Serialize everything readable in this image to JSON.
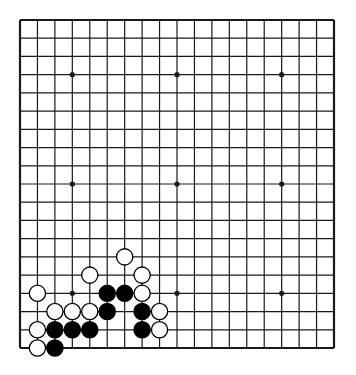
{
  "board": {
    "size": 19,
    "left": 20,
    "top": 20,
    "right": 334,
    "bottom": 348,
    "line_color": "#1a1a1a",
    "background": "#ffffff",
    "star_points": [
      [
        3,
        3
      ],
      [
        9,
        3
      ],
      [
        15,
        3
      ],
      [
        3,
        9
      ],
      [
        9,
        9
      ],
      [
        15,
        9
      ],
      [
        3,
        15
      ],
      [
        9,
        15
      ],
      [
        15,
        15
      ]
    ],
    "stones": [
      {
        "color": "white",
        "col": 6,
        "row": 13
      },
      {
        "color": "white",
        "col": 4,
        "row": 14
      },
      {
        "color": "white",
        "col": 7,
        "row": 14
      },
      {
        "color": "white",
        "col": 1,
        "row": 15
      },
      {
        "color": "black",
        "col": 5,
        "row": 15
      },
      {
        "color": "black",
        "col": 6,
        "row": 15
      },
      {
        "color": "white",
        "col": 7,
        "row": 15
      },
      {
        "color": "white",
        "col": 2,
        "row": 16
      },
      {
        "color": "white",
        "col": 3,
        "row": 16
      },
      {
        "color": "white",
        "col": 4,
        "row": 16
      },
      {
        "color": "black",
        "col": 5,
        "row": 16
      },
      {
        "color": "black",
        "col": 7,
        "row": 16
      },
      {
        "color": "white",
        "col": 8,
        "row": 16
      },
      {
        "color": "white",
        "col": 1,
        "row": 17
      },
      {
        "color": "black",
        "col": 2,
        "row": 17
      },
      {
        "color": "black",
        "col": 3,
        "row": 17
      },
      {
        "color": "black",
        "col": 4,
        "row": 17
      },
      {
        "color": "black",
        "col": 7,
        "row": 17
      },
      {
        "color": "white",
        "col": 8,
        "row": 17
      },
      {
        "color": "white",
        "col": 1,
        "row": 18
      },
      {
        "color": "black",
        "col": 2,
        "row": 18
      }
    ]
  }
}
